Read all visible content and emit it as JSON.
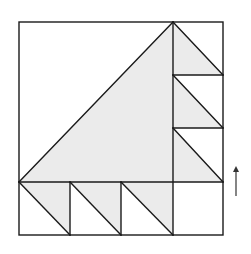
{
  "diagram": {
    "type": "quilt-block-geometry",
    "colors": {
      "fill": "#ebebeb",
      "stroke": "#1a1a1a",
      "background": "#ffffff",
      "arrow": "#333333"
    },
    "outer_square": {
      "x1": 19,
      "y1": 22,
      "x2": 223,
      "y2": 235
    },
    "grid": {
      "main_vertical_x": 173,
      "main_horizontal_y": 182,
      "right_column_dividers_y": [
        75,
        128
      ],
      "bottom_row_dividers_x": [
        70,
        121
      ]
    },
    "large_triangle": {
      "points": "19,182 173,22 173,182"
    },
    "right_triangles": [
      {
        "points": "173,22 223,75 173,75"
      },
      {
        "points": "173,75 223,128 173,128"
      },
      {
        "points": "173,128 223,182 173,182"
      }
    ],
    "bottom_triangles": [
      {
        "points": "19,182 70,182 70,235"
      },
      {
        "points": "70,182 121,182 121,235"
      },
      {
        "points": "121,182 173,182 173,235"
      }
    ],
    "arrow": {
      "direction": "up",
      "x": 236,
      "y_top": 168,
      "y_bottom": 196
    }
  }
}
